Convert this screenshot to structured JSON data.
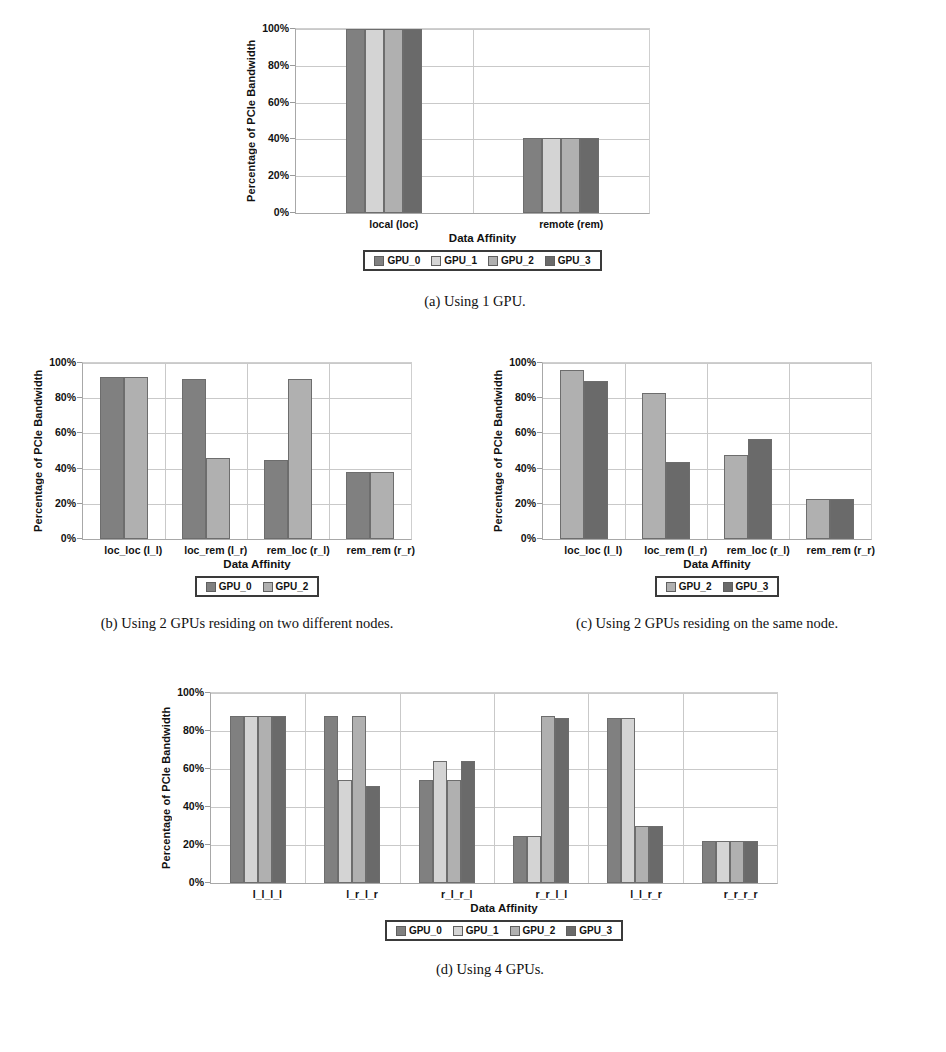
{
  "colors": {
    "GPU_0": "#808080",
    "GPU_1": "#d4d4d4",
    "GPU_2": "#b0b0b0",
    "GPU_3": "#6a6a6a",
    "grid": "#c9c9c9",
    "axis": "#a8a8a8",
    "bar_border": "#6d6d6d"
  },
  "common": {
    "ylabel": "Percentage of PCIe Bandwidth",
    "xlabel": "Data Affinity",
    "yticks": [
      "100%",
      "80%",
      "60%",
      "40%",
      "20%",
      "0%"
    ]
  },
  "captions": {
    "a": "(a) Using 1 GPU.",
    "b": "(b) Using 2 GPUs residing on two different nodes.",
    "c": "(c) Using 2 GPUs residing on the same node.",
    "d": "(d) Using 4 GPUs."
  },
  "chart_data": [
    {
      "id": "a",
      "type": "bar",
      "title": "(a) Using 1 GPU.",
      "xlabel": "Data Affinity",
      "ylabel": "Percentage of PCIe Bandwidth",
      "ylim": [
        0,
        100
      ],
      "yticks": [
        0,
        20,
        40,
        60,
        80,
        100
      ],
      "grid": true,
      "legend_position": "bottom",
      "categories": [
        "local (loc)",
        "remote (rem)"
      ],
      "series": [
        {
          "name": "GPU_0",
          "values": [
            100,
            41
          ]
        },
        {
          "name": "GPU_1",
          "values": [
            100,
            41
          ]
        },
        {
          "name": "GPU_2",
          "values": [
            100,
            41
          ]
        },
        {
          "name": "GPU_3",
          "values": [
            100,
            41
          ]
        }
      ]
    },
    {
      "id": "b",
      "type": "bar",
      "title": "(b) Using 2 GPUs residing on two different nodes.",
      "xlabel": "Data Affinity",
      "ylabel": "Percentage of PCIe Bandwidth",
      "ylim": [
        0,
        100
      ],
      "yticks": [
        0,
        20,
        40,
        60,
        80,
        100
      ],
      "grid": true,
      "legend_position": "bottom",
      "categories": [
        "loc_loc (l_l)",
        "loc_rem (l_r)",
        "rem_loc (r_l)",
        "rem_rem (r_r)"
      ],
      "series": [
        {
          "name": "GPU_0",
          "values": [
            92,
            91,
            45,
            38
          ]
        },
        {
          "name": "GPU_2",
          "values": [
            92,
            46,
            91,
            38
          ]
        }
      ]
    },
    {
      "id": "c",
      "type": "bar",
      "title": "(c) Using 2 GPUs residing on the same node.",
      "xlabel": "Data Affinity",
      "ylabel": "Percentage of PCIe Bandwidth",
      "ylim": [
        0,
        100
      ],
      "yticks": [
        0,
        20,
        40,
        60,
        80,
        100
      ],
      "grid": true,
      "legend_position": "bottom",
      "categories": [
        "loc_loc (l_l)",
        "loc_rem (l_r)",
        "rem_loc (r_l)",
        "rem_rem (r_r)"
      ],
      "series": [
        {
          "name": "GPU_2",
          "values": [
            96,
            83,
            48,
            23
          ]
        },
        {
          "name": "GPU_3",
          "values": [
            90,
            44,
            57,
            23
          ]
        }
      ]
    },
    {
      "id": "d",
      "type": "bar",
      "title": "(d) Using 4 GPUs.",
      "xlabel": "Data Affinity",
      "ylabel": "Percentage of PCIe Bandwidth",
      "ylim": [
        0,
        100
      ],
      "yticks": [
        0,
        20,
        40,
        60,
        80,
        100
      ],
      "grid": true,
      "legend_position": "bottom",
      "categories": [
        "l_l_l_l",
        "l_r_l_r",
        "r_l_r_l",
        "r_r_l_l",
        "l_l_r_r",
        "r_r_r_r"
      ],
      "series": [
        {
          "name": "GPU_0",
          "values": [
            88,
            88,
            54,
            25,
            87,
            22
          ]
        },
        {
          "name": "GPU_1",
          "values": [
            88,
            54,
            64,
            25,
            87,
            22
          ]
        },
        {
          "name": "GPU_2",
          "values": [
            88,
            88,
            54,
            88,
            30,
            22
          ]
        },
        {
          "name": "GPU_3",
          "values": [
            88,
            51,
            64,
            87,
            30,
            22
          ]
        }
      ]
    }
  ]
}
